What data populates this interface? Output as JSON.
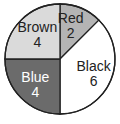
{
  "chart_data": {
    "type": "pie",
    "title": "",
    "total": 16,
    "start_angle": "top (12 o'clock)",
    "direction": "clockwise",
    "slices": [
      {
        "label": "Red",
        "value": 2,
        "fill": "#b4b4b4",
        "text_color": "#222222"
      },
      {
        "label": "Black",
        "value": 6,
        "fill": "#ffffff",
        "text_color": "#222222"
      },
      {
        "label": "Blue",
        "value": 4,
        "fill": "#6b6b6b",
        "text_color": "#ffffff"
      },
      {
        "label": "Brown",
        "value": 4,
        "fill": "#dadada",
        "text_color": "#222222"
      }
    ],
    "categories": [
      "Red",
      "Black",
      "Blue",
      "Brown"
    ],
    "values": [
      2,
      6,
      4,
      4
    ],
    "legend": "none (labels inside slices)"
  }
}
